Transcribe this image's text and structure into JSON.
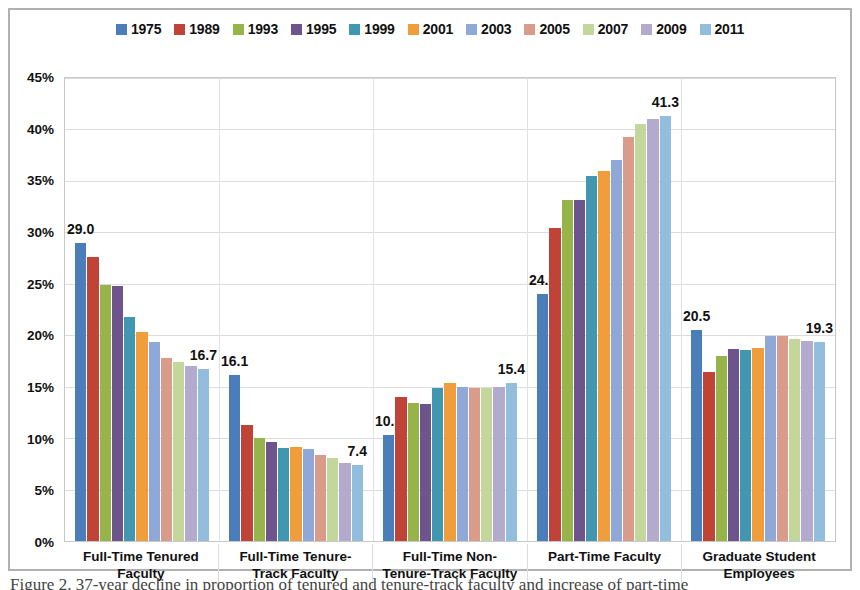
{
  "chart_data": {
    "type": "bar",
    "title": "",
    "xlabel": "",
    "ylabel": "",
    "ylim": [
      0,
      45
    ],
    "ytick_labels": [
      "45%",
      "40%",
      "35%",
      "30%",
      "25%",
      "20%",
      "15%",
      "10%",
      "5%",
      "0%"
    ],
    "ytick_values": [
      45,
      40,
      35,
      30,
      25,
      20,
      15,
      10,
      5,
      0
    ],
    "grid": true,
    "legend_position": "top",
    "categories": [
      "Full-Time Tenured Faculty",
      "Full-Time Tenure-Track Faculty",
      "Full-Time Non-Tenure-Track Faculty",
      "Part-Time Faculty",
      "Graduate Student Employees"
    ],
    "category_lines": [
      [
        "Full-Time Tenured",
        "Faculty"
      ],
      [
        "Full-Time Tenure-",
        "Track Faculty"
      ],
      [
        "Full-Time Non-",
        "Tenure-Track Faculty"
      ],
      [
        "Part-Time Faculty",
        ""
      ],
      [
        "Graduate Student",
        "Employees"
      ]
    ],
    "series": [
      {
        "name": "1975",
        "color": "#4a7ebb",
        "values": [
          29.0,
          16.1,
          10.3,
          24.0,
          20.5
        ]
      },
      {
        "name": "1989",
        "color": "#bf4337",
        "values": [
          27.6,
          11.3,
          14.0,
          30.4,
          16.4
        ]
      },
      {
        "name": "1993",
        "color": "#96b44a",
        "values": [
          24.9,
          10.0,
          13.4,
          33.1,
          18.0
        ]
      },
      {
        "name": "1995",
        "color": "#6e548d",
        "values": [
          24.8,
          9.6,
          13.3,
          33.1,
          18.7
        ]
      },
      {
        "name": "1999",
        "color": "#4196b0",
        "values": [
          21.8,
          9.0,
          14.9,
          35.5,
          18.6
        ]
      },
      {
        "name": "2001",
        "color": "#ef9e3b",
        "values": [
          20.3,
          9.1,
          15.4,
          36.0,
          18.8
        ]
      },
      {
        "name": "2003",
        "color": "#8fa8d8",
        "values": [
          19.3,
          8.9,
          15.0,
          37.0,
          19.9
        ]
      },
      {
        "name": "2005",
        "color": "#d99b8a",
        "values": [
          17.8,
          8.4,
          14.9,
          39.3,
          19.9
        ]
      },
      {
        "name": "2007",
        "color": "#c3d69b",
        "values": [
          17.4,
          8.1,
          14.9,
          40.5,
          19.6
        ]
      },
      {
        "name": "2009",
        "color": "#b2abcd",
        "values": [
          17.0,
          7.6,
          15.0,
          41.0,
          19.4
        ]
      },
      {
        "name": "2011",
        "color": "#92bddd",
        "values": [
          16.7,
          7.4,
          15.4,
          41.3,
          19.3
        ]
      }
    ],
    "annotations": [
      {
        "category_index": 0,
        "series_index": 0,
        "text": "29.0"
      },
      {
        "category_index": 0,
        "series_index": 10,
        "text": "16.7"
      },
      {
        "category_index": 1,
        "series_index": 0,
        "text": "16.1"
      },
      {
        "category_index": 1,
        "series_index": 10,
        "text": "7.4"
      },
      {
        "category_index": 2,
        "series_index": 0,
        "text": "10.3"
      },
      {
        "category_index": 2,
        "series_index": 10,
        "text": "15.4"
      },
      {
        "category_index": 3,
        "series_index": 0,
        "text": "24.0"
      },
      {
        "category_index": 3,
        "series_index": 10,
        "text": "41.3"
      },
      {
        "category_index": 4,
        "series_index": 0,
        "text": "20.5"
      },
      {
        "category_index": 4,
        "series_index": 10,
        "text": "19.3"
      }
    ]
  },
  "caption": {
    "text": "Figure 2. 37-year decline in proportion of tenured and tenure-track faculty and increase of part-time"
  }
}
